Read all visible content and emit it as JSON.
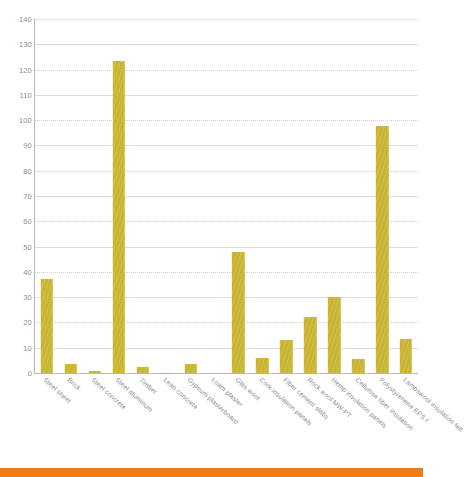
{
  "chart_data": {
    "type": "bar",
    "title": "",
    "subtitle": "",
    "xlabel": "",
    "ylabel": "",
    "ylim": [
      0,
      140
    ],
    "ytick_step": 10,
    "yticks": [
      0,
      10,
      20,
      30,
      40,
      50,
      60,
      70,
      80,
      90,
      100,
      110,
      120,
      130,
      140
    ],
    "grid": true,
    "legend": "none",
    "bar_color": "#c9b531",
    "categories": [
      "Steel sheet",
      "Brick",
      "Steel concrete",
      "Steel aluminum",
      "Timber",
      "Lean concrete",
      "Gypsum plasterboard",
      "Loam plaster",
      "Glas wool",
      "Cork insulation panels",
      "Fiber cement slabs",
      "Rock wool MW-PT",
      "Hemp insulation panels",
      "Cellulose fiber insulation",
      "Polystyrenene EPS f",
      "Lambswool insulation felt"
    ],
    "values": [
      37,
      3.5,
      0.6,
      123.5,
      2.2,
      0.2,
      3.5,
      0,
      48,
      6,
      13,
      22,
      30,
      5.5,
      97.5,
      13.5
    ]
  },
  "decor": {
    "accent_color": "#ef7d1a",
    "grid_color": "#dddde0",
    "axis_color": "#b8b8bc",
    "tick_text_color": "#8d8d91"
  }
}
